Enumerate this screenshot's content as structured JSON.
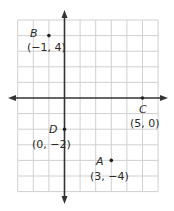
{
  "chart_data": {
    "type": "scatter",
    "title": "",
    "xlabel": "",
    "ylabel": "",
    "xlim": [
      -3,
      6
    ],
    "ylim": [
      -6,
      5
    ],
    "grid": true,
    "legend": null,
    "points": [
      {
        "name": "B",
        "x": -1,
        "y": 4,
        "label": "(−1, 4)"
      },
      {
        "name": "C",
        "x": 5,
        "y": 0,
        "label": "(5, 0)"
      },
      {
        "name": "D",
        "x": 0,
        "y": -2,
        "label": "(0, −2)"
      },
      {
        "name": "A",
        "x": 3,
        "y": -4,
        "label": "(3, −4)"
      }
    ]
  },
  "colors": {
    "grid": "#d0d0d0",
    "axis": "#333333",
    "point": "#222222",
    "text": "#2a2a2a"
  }
}
